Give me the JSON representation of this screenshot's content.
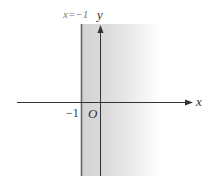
{
  "figure": {
    "line_label": "x=−1",
    "x_axis_label": "x",
    "y_axis_label": "y",
    "origin_label": "O",
    "tick_label": "−1",
    "boundary_x": -1,
    "shading": "right of boundary, fading",
    "colors": {
      "shade": "#d4d4d4",
      "axis": "#333333",
      "boundary": "#666666"
    }
  }
}
